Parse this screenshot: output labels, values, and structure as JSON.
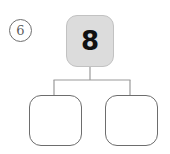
{
  "worksheet": {
    "problem_number": "6",
    "background_color": "#ffffff"
  },
  "number_bond": {
    "parent": {
      "value": "8",
      "fill_color": "#dcdcdc",
      "border_color": "#c2c2c2"
    },
    "children": [
      {
        "position": "left",
        "value": "",
        "fill_color": "#ffffff",
        "border_color": "#6d6d6d"
      },
      {
        "position": "right",
        "value": "",
        "fill_color": "#ffffff",
        "border_color": "#6d6d6d"
      }
    ],
    "connector_color": "#9a9a9a"
  }
}
